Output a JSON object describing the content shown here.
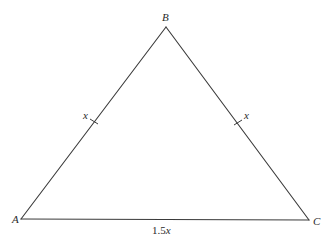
{
  "diagram": {
    "type": "isosceles-triangle",
    "colors": {
      "background": "#ffffff",
      "stroke": "#3a3a3a",
      "text": "#2a2a2a"
    },
    "vertices": {
      "A": {
        "label": "A",
        "x": 21,
        "y": 219
      },
      "B": {
        "label": "B",
        "x": 166,
        "y": 27
      },
      "C": {
        "label": "C",
        "x": 309,
        "y": 220
      }
    },
    "sides": {
      "AB": {
        "label": "x",
        "tick_mark": true
      },
      "BC": {
        "label": "x",
        "tick_mark": true
      },
      "AC": {
        "label_number": "1.5",
        "label_var": "x",
        "tick_mark": false
      }
    }
  }
}
